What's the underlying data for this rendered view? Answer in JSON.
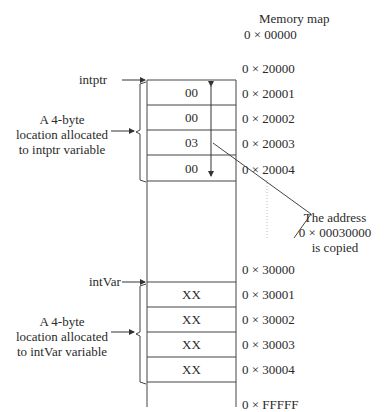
{
  "title": "Memory map",
  "start_address": "0 × 00000",
  "end_address": "0 × FFFFF",
  "pointer_block": {
    "label": "intptr",
    "description": [
      "A 4-byte",
      "location allocated",
      "to intptr variable"
    ],
    "base_address": "0 × 20000",
    "cells": [
      {
        "value": "00",
        "address": "0 × 20001"
      },
      {
        "value": "00",
        "address": "0 × 20002"
      },
      {
        "value": "03",
        "address": "0 × 20003"
      },
      {
        "value": "00",
        "address": "0 × 20004"
      }
    ]
  },
  "var_block": {
    "label": "intVar",
    "description": [
      "A 4-byte",
      "location allocated",
      "to intVar variable"
    ],
    "base_address": "0 × 30000",
    "cells": [
      {
        "value": "XX",
        "address": "0 × 30001"
      },
      {
        "value": "XX",
        "address": "0 × 30002"
      },
      {
        "value": "XX",
        "address": "0 × 30003"
      },
      {
        "value": "XX",
        "address": "0 × 30004"
      }
    ]
  },
  "callout": [
    "The address",
    "0 × 00030000",
    "is copied"
  ],
  "colors": {
    "line": "#333333",
    "text": "#2a2a2a",
    "background": "#ffffff"
  }
}
